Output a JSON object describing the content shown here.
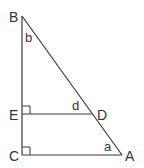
{
  "diagram": {
    "type": "geometry-triangle",
    "stroke_color": "#3a3a3a",
    "points": {
      "B": {
        "label": "B",
        "x": 22,
        "y": 16
      },
      "C": {
        "label": "C",
        "x": 22,
        "y": 155
      },
      "A": {
        "label": "A",
        "x": 122,
        "y": 155
      },
      "E": {
        "label": "E",
        "x": 22,
        "y": 114
      },
      "D": {
        "label": "D",
        "x": 92,
        "y": 114
      }
    },
    "angles": {
      "b": {
        "label": "b",
        "vertex": "B"
      },
      "d": {
        "label": "d",
        "vertex": "D"
      },
      "a": {
        "label": "a",
        "vertex": "A"
      }
    },
    "segments": [
      "BC",
      "CA",
      "AB",
      "ED"
    ],
    "right_angles": [
      "E",
      "C"
    ]
  }
}
